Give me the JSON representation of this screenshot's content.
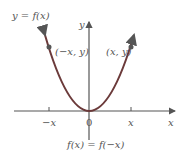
{
  "title": "y = f(x)",
  "axes": {
    "x_label": "x",
    "y_label": "y",
    "origin_label": "0"
  },
  "ticks": {
    "neg": "−x",
    "pos": "x"
  },
  "points": {
    "left": "(−x, y)",
    "right": "(x, y)"
  },
  "caption": "f(x) = f(−x)",
  "colors": {
    "curve": "#6b3a3a",
    "axis": "#555555",
    "point": "#555555"
  }
}
